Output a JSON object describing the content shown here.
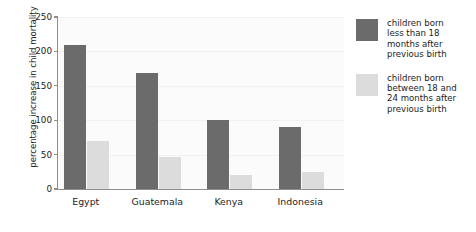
{
  "chart_data": {
    "type": "bar",
    "title": "",
    "xlabel": "",
    "ylabel": "percentage increase in child mortality",
    "categories": [
      "Egypt",
      "Guatemala",
      "Kenya",
      "Indonesia"
    ],
    "series": [
      {
        "name": "children born less than 18 months after previous birth",
        "color": "#6b6b6b",
        "values": [
          210,
          168,
          100,
          90
        ]
      },
      {
        "name": "children born between 18 and 24 months after previous birth",
        "color": "#dcdcdc",
        "values": [
          70,
          47,
          20,
          25
        ]
      }
    ],
    "ylim": [
      0,
      250
    ],
    "yticks": [
      0,
      50,
      100,
      150,
      200,
      250
    ],
    "ytick_labels": [
      "0",
      "50",
      "100",
      "150",
      "200",
      "250"
    ],
    "grid": true,
    "legend_position": "right"
  },
  "legend": {
    "entries": [
      {
        "label": "children born\nless than 18\nmonths after\nprevious birth"
      },
      {
        "label": "children born\nbetween 18 and\n24 months after\nprevious birth"
      }
    ]
  }
}
